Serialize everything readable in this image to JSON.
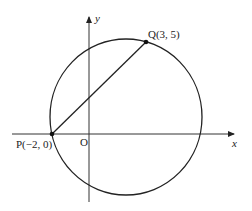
{
  "diagram": {
    "axes": {
      "x_label": "x",
      "y_label": "y",
      "origin_label": "O"
    },
    "points": [
      {
        "name": "P",
        "label": "P(−2, 0)",
        "x": -2,
        "y": 0
      },
      {
        "name": "Q",
        "label": "Q(3, 5)",
        "x": 3,
        "y": 5
      }
    ],
    "shapes": [
      "circle through P and Q",
      "line segment PQ"
    ],
    "colors": {
      "stroke": "#222222",
      "background": "#ffffff"
    }
  }
}
